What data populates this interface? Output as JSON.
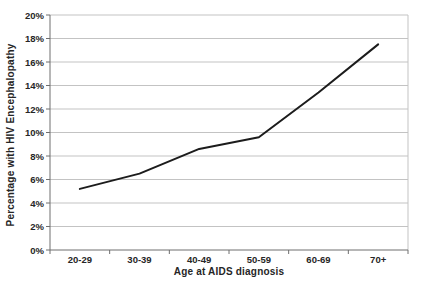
{
  "chart_data": {
    "type": "line",
    "categories": [
      "20-29",
      "30-39",
      "40-49",
      "50-59",
      "60-69",
      "70+"
    ],
    "values": [
      5.2,
      6.5,
      8.6,
      9.6,
      13.4,
      17.5
    ],
    "series": [
      {
        "name": "Percentage with HIV Encephalopathy",
        "values": [
          5.2,
          6.5,
          8.6,
          9.6,
          13.4,
          17.5
        ]
      }
    ],
    "title": "",
    "xlabel": "Age at AIDS diagnosis",
    "ylabel": "Percentage with HIV Encephalopathy",
    "ylim": [
      0,
      20
    ],
    "ytick_step": 2,
    "ytick_labels": [
      "0%",
      "2%",
      "4%",
      "6%",
      "8%",
      "10%",
      "12%",
      "14%",
      "16%",
      "18%",
      "20%"
    ],
    "grid": true,
    "legend": "none",
    "colors": {
      "line": "#1c1c1c",
      "grid": "#c3c3c3",
      "axis": "#6e6e6e",
      "text": "#262626",
      "background": "#ffffff"
    }
  }
}
